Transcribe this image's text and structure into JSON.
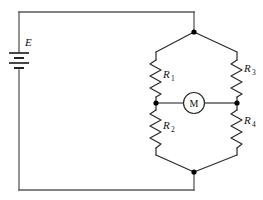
{
  "figure": {
    "kind": "circuit-diagram",
    "background_color": "#ffffff",
    "wire_color": "#5a5a5a",
    "node_color": "#000000",
    "label_color": "#111111"
  },
  "source": {
    "name": "E",
    "type": "battery",
    "label": "E",
    "plate_count": 4
  },
  "meter": {
    "name": "M",
    "label": "M",
    "type": "galvanometer"
  },
  "resistors": [
    {
      "id": "R1",
      "label": "R",
      "subscript": "1",
      "position": "upper-left-branch"
    },
    {
      "id": "R2",
      "label": "R",
      "subscript": "2",
      "position": "lower-left-branch"
    },
    {
      "id": "R3",
      "label": "R",
      "subscript": "3",
      "position": "upper-right-branch"
    },
    {
      "id": "R4",
      "label": "R",
      "subscript": "4",
      "position": "lower-right-branch"
    }
  ],
  "nodes": [
    {
      "id": "top-apex",
      "x": 194,
      "y": 32
    },
    {
      "id": "bridge-left",
      "x": 155,
      "y": 103
    },
    {
      "id": "bridge-right",
      "x": 238,
      "y": 103
    },
    {
      "id": "bottom-apex",
      "x": 194,
      "y": 172
    }
  ]
}
